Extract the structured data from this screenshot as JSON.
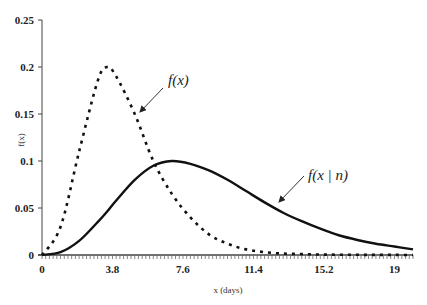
{
  "chart_data": {
    "type": "line",
    "title": "",
    "xlabel": "x (days)",
    "ylabel": "f(x)",
    "xlim": [
      0,
      20
    ],
    "ylim": [
      0,
      0.25
    ],
    "x_ticks": [
      "0",
      "3.8",
      "7.6",
      "11.4",
      "15.2",
      "19"
    ],
    "x_tick_values": [
      0,
      3.8,
      7.6,
      11.4,
      15.2,
      19
    ],
    "y_ticks": [
      "0",
      "0.05",
      "0.1",
      "0.15",
      "0.2",
      "0.25"
    ],
    "y_tick_values": [
      0,
      0.05,
      0.1,
      0.15,
      0.2,
      0.25
    ],
    "grid": false,
    "legend": null,
    "x": [
      0,
      1,
      2,
      3,
      3.5,
      4,
      5,
      6,
      7,
      8,
      9,
      10,
      11,
      12,
      13,
      14,
      15,
      16,
      17,
      18,
      19,
      20
    ],
    "series": [
      {
        "name": "f(x)",
        "style": "dashed",
        "values": [
          0,
          0.03,
          0.11,
          0.185,
          0.2,
          0.19,
          0.15,
          0.1,
          0.065,
          0.04,
          0.022,
          0.012,
          0.006,
          0.003,
          0.0015,
          0.001,
          0.0005,
          0.0003,
          0.0002,
          0.0001,
          0.0001,
          0
        ]
      },
      {
        "name": "f(x | n)",
        "style": "solid",
        "values": [
          0,
          0.003,
          0.015,
          0.035,
          0.046,
          0.058,
          0.08,
          0.095,
          0.1,
          0.097,
          0.09,
          0.08,
          0.068,
          0.056,
          0.045,
          0.036,
          0.028,
          0.021,
          0.016,
          0.012,
          0.009,
          0.006
        ]
      }
    ],
    "annotations": [
      {
        "text": "f(x)",
        "arrow_to_series": "f(x)"
      },
      {
        "text": "f(x | n)",
        "arrow_to_series": "f(x | n)"
      }
    ]
  }
}
